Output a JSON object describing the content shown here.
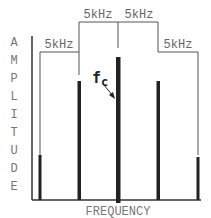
{
  "diagram": {
    "y_axis_label_letters": [
      "A",
      "M",
      "P",
      "L",
      "I",
      "T",
      "U",
      "D",
      "E"
    ],
    "x_axis_label": "FREQUENCY",
    "carrier_label": "f",
    "carrier_subscript": "c",
    "spacing_labels": {
      "outer_left": "5kHz",
      "inner_left": "5kHz",
      "inner_right": "5kHz",
      "outer_right": "5kHz"
    },
    "spectral_lines": [
      {
        "name": "lower-outer-sideband",
        "relative_height": 0.3
      },
      {
        "name": "lower-inner-sideband",
        "relative_height": 0.8
      },
      {
        "name": "carrier",
        "relative_height": 1.0
      },
      {
        "name": "upper-inner-sideband",
        "relative_height": 0.8
      },
      {
        "name": "upper-outer-sideband",
        "relative_height": 0.3
      }
    ]
  }
}
